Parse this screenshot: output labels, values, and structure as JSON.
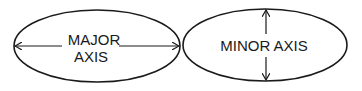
{
  "diagram": {
    "left": {
      "title": "Major axis ellipse",
      "line1": "MAJOR",
      "line2": "AXIS"
    },
    "right": {
      "title": "Minor axis ellipse",
      "label": "MINOR AXIS"
    },
    "colors": {
      "stroke": "#1a1a1a",
      "background": "#ffffff"
    }
  }
}
